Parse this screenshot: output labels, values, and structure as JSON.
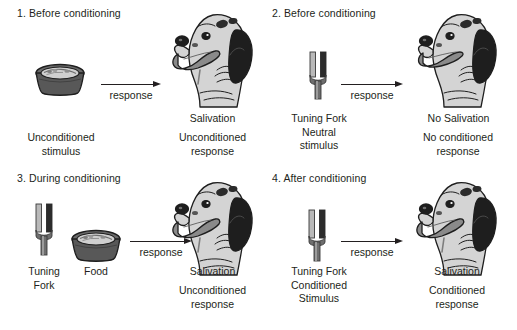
{
  "figure": {
    "background_color": "#ffffff",
    "ink_color": "#231f20"
  },
  "panels": [
    {
      "id": "panel-1",
      "title": "1. Before conditioning",
      "stimulus_icons": [
        "food-bowl-icon"
      ],
      "stimulus_caption": [
        "Unconditioned",
        "stimulus"
      ],
      "arrow_label": "response",
      "response_caption": [
        "Salivation"
      ],
      "response_sub_caption": [
        "Unconditioned",
        "response"
      ],
      "dog_icon": "dog-head-salivating-icon"
    },
    {
      "id": "panel-2",
      "title": "2. Before conditioning",
      "stimulus_icons": [
        "tuning-fork-icon"
      ],
      "stimulus_caption": [
        "Tuning Fork",
        "Neutral",
        "stimulus"
      ],
      "arrow_label": "response",
      "response_caption": [
        "No Salivation"
      ],
      "response_sub_caption": [
        "No conditioned",
        "response"
      ],
      "dog_icon": "dog-head-icon"
    },
    {
      "id": "panel-3",
      "title": "3. During conditioning",
      "stimulus_icons": [
        "tuning-fork-icon",
        "food-bowl-icon"
      ],
      "stimulus_caption": [
        "Tuning",
        "Fork"
      ],
      "stimulus_caption_2": [
        "Food"
      ],
      "arrow_label": "response",
      "response_caption": [
        "Salivation"
      ],
      "response_sub_caption": [
        "Unconditioned",
        "response"
      ],
      "dog_icon": "dog-head-salivating-icon"
    },
    {
      "id": "panel-4",
      "title": "4. After conditioning",
      "stimulus_icons": [
        "tuning-fork-icon"
      ],
      "stimulus_caption": [
        "Tuning Fork",
        "Conditioned",
        "Stimulus"
      ],
      "arrow_label": "response",
      "response_caption": [
        "Salivation"
      ],
      "response_sub_caption": [
        "Conditioned",
        "response"
      ],
      "dog_icon": "dog-head-salivating-icon"
    }
  ],
  "palette": {
    "ink": "#231f20",
    "fork_light": "#b9b9b9",
    "fork_dark": "#2c2c2c",
    "fork_stem": "#6e6e6e",
    "bowl_body": "#5a5a5a",
    "bowl_rim": "#8d8d8d",
    "bowl_food": "#cfcfcf",
    "dog_body": "#d4d4d4",
    "dog_dark": "#1e1e1e",
    "dog_tongue": "#8a8a8a"
  }
}
